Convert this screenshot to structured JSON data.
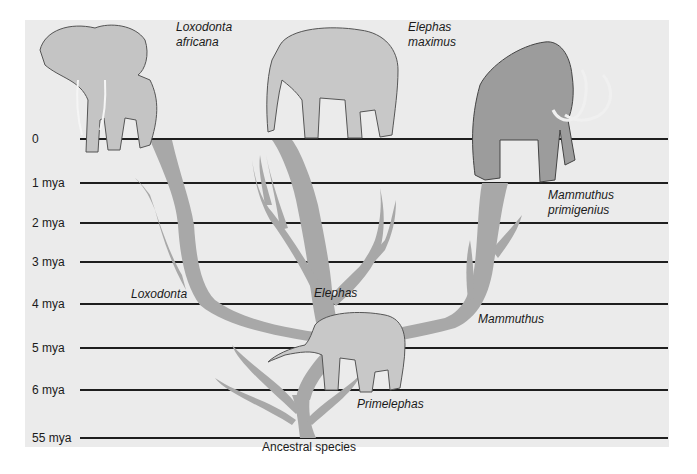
{
  "diagram": {
    "type": "phylogenetic-tree",
    "colors": {
      "background_panel": "#ebebeb",
      "branch": "#a8a8a8",
      "timeline": "#1e1e1e",
      "text": "#1a1a1a"
    },
    "timeline": [
      {
        "label": "0",
        "y": 139
      },
      {
        "label": "1 mya",
        "y": 183
      },
      {
        "label": "2 mya",
        "y": 223
      },
      {
        "label": "3 mya",
        "y": 262
      },
      {
        "label": "4 mya",
        "y": 304
      },
      {
        "label": "5 mya",
        "y": 348
      },
      {
        "label": "6 mya",
        "y": 390
      },
      {
        "label": "55 mya",
        "y": 438
      }
    ],
    "species": [
      {
        "name_line1": "Loxodonta",
        "name_line2": "africana",
        "illustration": "african-elephant"
      },
      {
        "name_line1": "Elephas",
        "name_line2": "maximus",
        "illustration": "asian-elephant"
      },
      {
        "name_line1": "Mammuthus",
        "name_line2": "primigenius",
        "illustration": "woolly-mammoth"
      }
    ],
    "genera": [
      {
        "name": "Loxodonta"
      },
      {
        "name": "Elephas"
      },
      {
        "name": "Mammuthus"
      },
      {
        "name": "Primelephas"
      }
    ],
    "root": {
      "label": "Ancestral species"
    }
  }
}
